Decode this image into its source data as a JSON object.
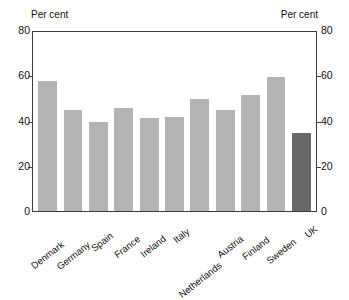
{
  "title": "",
  "axis_caption_left": "Per cent",
  "axis_caption_right": "Per cent",
  "ticks": [
    "80",
    "60",
    "40",
    "20",
    "0"
  ],
  "chart_data": {
    "type": "bar",
    "title": "",
    "xlabel": "",
    "ylabel": "Per cent",
    "ylim": [
      0,
      80
    ],
    "yticks": [
      0,
      20,
      40,
      60,
      80
    ],
    "grid": false,
    "legend": "none",
    "axis_caption_left": "Per cent",
    "axis_caption_right": "Per cent",
    "dual_axis": true,
    "categories": [
      "Denmark",
      "Germany",
      "Spain",
      "France",
      "Ireland",
      "Italy",
      "Netherlands",
      "Austria",
      "Finland",
      "Sweden",
      "UK"
    ],
    "values": [
      58,
      45,
      40,
      46,
      41.5,
      42,
      50,
      45,
      52,
      60,
      35
    ],
    "bar_colors": [
      "#b3b3b3",
      "#b3b3b3",
      "#b3b3b3",
      "#b3b3b3",
      "#b3b3b3",
      "#b3b3b3",
      "#b3b3b3",
      "#b3b3b3",
      "#b3b3b3",
      "#b3b3b3",
      "#686868"
    ],
    "highlight_category": "UK",
    "highlight_color": "#686868",
    "series_color": "#b3b3b3"
  }
}
